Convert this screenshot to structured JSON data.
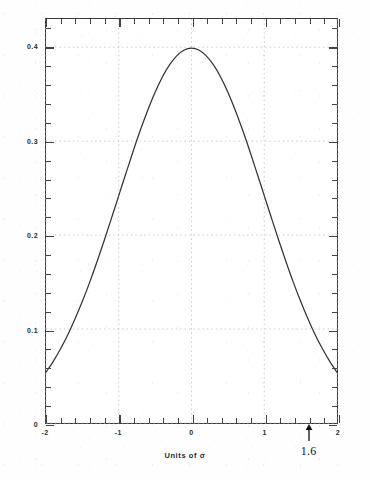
{
  "chart_data": {
    "type": "line",
    "title": "",
    "subtitle": "",
    "xlabel": "Units of σ",
    "ylabel": "",
    "xlim": [
      -2,
      2
    ],
    "ylim": [
      0,
      0.43
    ],
    "grid": true,
    "legend": null,
    "x_ticks": [
      {
        "value": -2,
        "label": "-2"
      },
      {
        "value": -1,
        "label": "-1"
      },
      {
        "value": 0,
        "label": "0"
      },
      {
        "value": 1,
        "label": "1"
      },
      {
        "value": 2,
        "label": "2"
      }
    ],
    "y_ticks": [
      {
        "value": 0,
        "label": "0"
      },
      {
        "value": 0.1,
        "label": "0.1"
      },
      {
        "value": 0.2,
        "label": "0.2"
      },
      {
        "value": 0.3,
        "label": "0.3"
      },
      {
        "value": 0.4,
        "label": "0.4"
      }
    ],
    "x_minor_tick_step": 0.2,
    "y_minor_tick_step": 0.02,
    "series": [
      {
        "name": "standard normal pdf",
        "color": "#333333",
        "x": [
          -2,
          -1.9,
          -1.8,
          -1.7,
          -1.6,
          -1.5,
          -1.4,
          -1.3,
          -1.2,
          -1.1,
          -1,
          -0.9,
          -0.8,
          -0.7,
          -0.6,
          -0.5,
          -0.4,
          -0.3,
          -0.2,
          -0.1,
          0,
          0.1,
          0.2,
          0.3,
          0.4,
          0.5,
          0.6,
          0.7,
          0.8,
          0.9,
          1,
          1.1,
          1.2,
          1.3,
          1.4,
          1.5,
          1.6,
          1.7,
          1.8,
          1.9,
          2
        ],
        "y": [
          0.054,
          0.0656,
          0.079,
          0.094,
          0.1109,
          0.1295,
          0.1497,
          0.1714,
          0.1942,
          0.2179,
          0.242,
          0.2661,
          0.2897,
          0.3123,
          0.3332,
          0.3521,
          0.3683,
          0.3814,
          0.391,
          0.397,
          0.3989,
          0.397,
          0.391,
          0.3814,
          0.3683,
          0.3521,
          0.3332,
          0.3123,
          0.2897,
          0.2661,
          0.242,
          0.2179,
          0.1942,
          0.1714,
          0.1497,
          0.1295,
          0.1109,
          0.094,
          0.079,
          0.0656,
          0.054
        ]
      }
    ],
    "annotations": [
      {
        "name": "sigma-marker",
        "label": "1.6",
        "x": 1.6,
        "y": 0,
        "marker": "up-arrow"
      }
    ]
  }
}
